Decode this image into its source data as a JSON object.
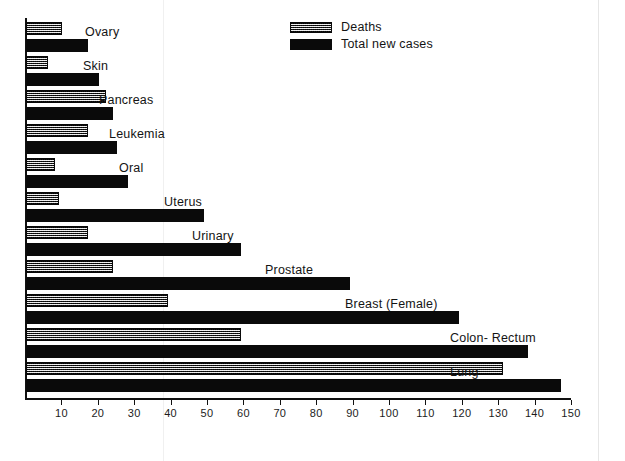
{
  "legend": {
    "position": "top-center",
    "entries": [
      {
        "label": "Deaths",
        "style": "hatched-gray",
        "color": "#8e8e8e"
      },
      {
        "label": "Total  new  cases",
        "style": "solid-black",
        "color": "#0a0a0a"
      }
    ]
  },
  "axis": {
    "tick_labels": [
      "10",
      "20",
      "30",
      "40",
      "50",
      "60",
      "70",
      "80",
      "90",
      "100",
      "110",
      "120",
      "130",
      "140",
      "150"
    ]
  },
  "chart_data": {
    "type": "bar",
    "orientation": "horizontal",
    "title": "",
    "subtitle": "",
    "xlabel": "",
    "ylabel": "",
    "xlim": [
      0,
      150
    ],
    "grid": false,
    "legend_position": "top-center",
    "categories": [
      "Ovary",
      "Skin",
      "Pancreas",
      "Leukemia",
      "Oral",
      "Uterus",
      "Urinary",
      "Prostate",
      "Breast (Female)",
      "Colon- Rectum",
      "Lung"
    ],
    "xticks": [
      10,
      20,
      30,
      40,
      50,
      60,
      70,
      80,
      90,
      100,
      110,
      120,
      130,
      140,
      150
    ],
    "series": [
      {
        "name": "Deaths",
        "color": "#8e8e8e",
        "values": [
          10,
          6,
          22,
          17,
          8,
          9,
          17,
          24,
          39,
          59,
          131
        ]
      },
      {
        "name": "Total  new  cases",
        "color": "#0a0a0a",
        "values": [
          17,
          20,
          24,
          25,
          28,
          49,
          59,
          89,
          119,
          138,
          147
        ]
      }
    ],
    "annotations": []
  },
  "label_offsets_px": [
    60,
    58,
    74,
    84,
    94,
    139,
    167,
    240,
    320,
    425,
    425
  ]
}
